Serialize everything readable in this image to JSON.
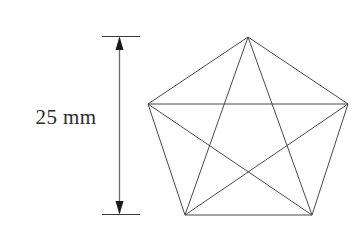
{
  "figure": {
    "background_color": "#ffffff",
    "line_color": "#4a4a4a",
    "dimension_color": "#3a3a3a",
    "text_color": "#2b2b2b"
  },
  "dimension": {
    "label": "25 mm",
    "value": 25,
    "unit": "mm",
    "orientation": "vertical",
    "measures": "pentagon-height",
    "line_x": 119,
    "top_y": 37,
    "bottom_y": 214,
    "extension_left_x": 102,
    "extension_right_x": 140,
    "label_x": 66,
    "label_y": 124,
    "arrow_top_name": "arrowhead-up",
    "arrow_bottom_name": "arrowhead-down"
  },
  "shape": {
    "name": "regular-pentagon",
    "sides": 5,
    "diagonals_drawn": 5,
    "inner_figure": "pentagram",
    "center_x": 248,
    "center_y": 135,
    "vertices": [
      {
        "id": "top",
        "x": 248,
        "y": 37
      },
      {
        "id": "right",
        "x": 348,
        "y": 104
      },
      {
        "id": "bottom-right",
        "x": 312,
        "y": 215
      },
      {
        "id": "bottom-left",
        "x": 185,
        "y": 215
      },
      {
        "id": "left",
        "x": 148,
        "y": 104
      }
    ],
    "edges": [
      {
        "from": "top",
        "to": "right"
      },
      {
        "from": "right",
        "to": "bottom-right"
      },
      {
        "from": "bottom-right",
        "to": "bottom-left"
      },
      {
        "from": "bottom-left",
        "to": "left"
      },
      {
        "from": "left",
        "to": "top"
      }
    ],
    "diagonals": [
      {
        "from": "top",
        "to": "bottom-right"
      },
      {
        "from": "top",
        "to": "bottom-left"
      },
      {
        "from": "right",
        "to": "bottom-left"
      },
      {
        "from": "right",
        "to": "left"
      },
      {
        "from": "bottom-right",
        "to": "left"
      }
    ]
  }
}
